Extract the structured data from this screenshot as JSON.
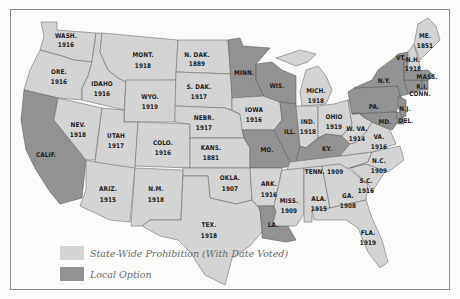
{
  "colors": {
    "statewide": "#d4d4d4",
    "local": "#929292",
    "background": "#fbfbfa",
    "border": "#6e6e6e"
  },
  "legend": {
    "statewide_label": "State-Wide Prohibition (With Date Voted)",
    "local_label": "Local Option"
  },
  "states": {
    "wash": {
      "name": "WASH.",
      "year": "1916",
      "status": "statewide"
    },
    "ore": {
      "name": "ORE.",
      "year": "1916",
      "status": "statewide"
    },
    "calif": {
      "name": "CALIF.",
      "year": "",
      "status": "local"
    },
    "idaho": {
      "name": "IDAHO",
      "year": "1916",
      "status": "statewide"
    },
    "nev": {
      "name": "NEV.",
      "year": "1918",
      "status": "statewide"
    },
    "mont": {
      "name": "MONT.",
      "year": "1918",
      "status": "statewide"
    },
    "wyo": {
      "name": "WYO.",
      "year": "1919",
      "status": "statewide"
    },
    "utah": {
      "name": "UTAH",
      "year": "1917",
      "status": "statewide"
    },
    "colo": {
      "name": "COLO.",
      "year": "1916",
      "status": "statewide"
    },
    "ariz": {
      "name": "ARIZ.",
      "year": "1915",
      "status": "statewide"
    },
    "nm": {
      "name": "N.M.",
      "year": "1918",
      "status": "statewide"
    },
    "ndak": {
      "name": "N. DAK.",
      "year": "1889",
      "status": "statewide"
    },
    "sdak": {
      "name": "S. DAK.",
      "year": "1917",
      "status": "statewide"
    },
    "nebr": {
      "name": "NEBR.",
      "year": "1917",
      "status": "statewide"
    },
    "kans": {
      "name": "KANS.",
      "year": "1881",
      "status": "statewide"
    },
    "okla": {
      "name": "OKLA.",
      "year": "1907",
      "status": "statewide"
    },
    "tex": {
      "name": "TEX.",
      "year": "1918",
      "status": "statewide"
    },
    "minn": {
      "name": "MINN.",
      "year": "",
      "status": "local"
    },
    "iowa": {
      "name": "IOWA",
      "year": "1916",
      "status": "statewide"
    },
    "mo": {
      "name": "MO.",
      "year": "",
      "status": "local"
    },
    "ark": {
      "name": "ARK.",
      "year": "1916",
      "status": "statewide"
    },
    "la": {
      "name": "LA.",
      "year": "",
      "status": "local"
    },
    "wis": {
      "name": "WIS.",
      "year": "",
      "status": "local"
    },
    "ill": {
      "name": "ILL.",
      "year": "",
      "status": "local"
    },
    "mich": {
      "name": "MICH.",
      "year": "1918",
      "status": "statewide"
    },
    "ind": {
      "name": "IND.",
      "year": "1918",
      "status": "statewide"
    },
    "ohio": {
      "name": "OHIO",
      "year": "1919",
      "status": "statewide"
    },
    "ky": {
      "name": "KY.",
      "year": "",
      "status": "local"
    },
    "tenn": {
      "name": "TENN.",
      "year": "1909",
      "status": "statewide"
    },
    "miss": {
      "name": "MISS.",
      "year": "1909",
      "status": "statewide"
    },
    "ala": {
      "name": "ALA.",
      "year": "1915",
      "status": "statewide"
    },
    "ga": {
      "name": "GA.",
      "year": "1908",
      "status": "statewide"
    },
    "fla": {
      "name": "FLA.",
      "year": "1919",
      "status": "statewide"
    },
    "sc": {
      "name": "S.C.",
      "year": "1916",
      "status": "statewide"
    },
    "nc": {
      "name": "N.C.",
      "year": "1909",
      "status": "statewide"
    },
    "va": {
      "name": "VA.",
      "year": "1916",
      "status": "statewide"
    },
    "wva": {
      "name": "W. VA.",
      "year": "1914",
      "status": "statewide"
    },
    "md": {
      "name": "MD.",
      "year": "",
      "status": "local"
    },
    "del": {
      "name": "DEL.",
      "year": "",
      "status": "local"
    },
    "pa": {
      "name": "PA.",
      "year": "",
      "status": "local"
    },
    "nj": {
      "name": "N.J.",
      "year": "",
      "status": "local"
    },
    "ny": {
      "name": "N.Y.",
      "year": "",
      "status": "local"
    },
    "conn": {
      "name": "CONN.",
      "year": "",
      "status": "local"
    },
    "ri": {
      "name": "R.I.",
      "year": "",
      "status": "local"
    },
    "mass": {
      "name": "MASS.",
      "year": "",
      "status": "local"
    },
    "vt": {
      "name": "VT.",
      "year": "",
      "status": "local"
    },
    "nh": {
      "name": "N.H.",
      "year": "1918",
      "status": "statewide"
    },
    "me": {
      "name": "ME.",
      "year": "1851",
      "status": "statewide"
    }
  }
}
